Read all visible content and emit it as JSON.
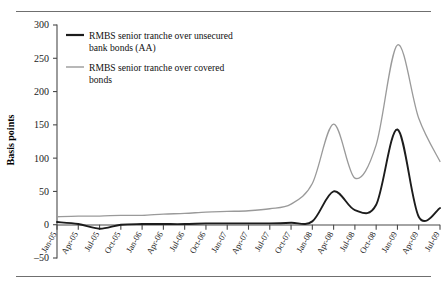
{
  "chart_data": {
    "type": "line",
    "title": "",
    "xlabel": "",
    "ylabel": "Basis points",
    "ylim": [
      -50,
      300
    ],
    "yticks": [
      -50,
      0,
      50,
      100,
      150,
      200,
      250,
      300
    ],
    "ytick_labels": [
      "–50",
      "0",
      "50",
      "100",
      "150",
      "200",
      "250",
      "300"
    ],
    "grid": false,
    "legend_position": "top-left",
    "categories": [
      "Jan-05",
      "Apr-05",
      "Jul-05",
      "Oct-05",
      "Jan-06",
      "Apr-06",
      "Jul-06",
      "Oct-06",
      "Jan-07",
      "Apr-07",
      "Jul-07",
      "Oct-07",
      "Jan-08",
      "Apr-08",
      "Jul-08",
      "Oct-08",
      "Jan-09",
      "Apr-09",
      "Jul-09"
    ],
    "series": [
      {
        "name": "RMBS senior tranche over unsecured bank bonds (AA)",
        "color": "#1c1c1c",
        "values": [
          4,
          1,
          -6,
          0,
          1,
          1,
          1,
          2,
          2,
          2,
          2,
          3,
          5,
          50,
          22,
          30,
          143,
          12,
          25
        ]
      },
      {
        "name": "RMBS senior tranche over covered bonds",
        "color": "#9a9a9a",
        "values": [
          12,
          13,
          13,
          14,
          14,
          16,
          17,
          19,
          20,
          21,
          24,
          31,
          62,
          151,
          70,
          120,
          270,
          160,
          95
        ]
      }
    ]
  },
  "legend": {
    "entries": [
      {
        "line1": "RMBS senior tranche over unsecured",
        "line2": "bank bonds (AA)",
        "swatch": "black-line-swatch"
      },
      {
        "line1": "RMBS senior tranche over covered",
        "line2": "bonds",
        "swatch": "grey-line-swatch"
      }
    ]
  },
  "axis": {
    "y_title": "Basis points",
    "y_ticks": [
      "300",
      "250",
      "200",
      "150",
      "100",
      "50",
      "0",
      "–50"
    ],
    "x_ticks": [
      "Jan-05",
      "Apr-05",
      "Jul-05",
      "Oct-05",
      "Jan-06",
      "Apr-06",
      "Jul-06",
      "Oct-06",
      "Jan-07",
      "Apr-07",
      "Jul-07",
      "Oct-07",
      "Jan-08",
      "Apr-08",
      "Jul-08",
      "Oct-08",
      "Jan-09",
      "Apr-09",
      "Jul-09"
    ]
  }
}
